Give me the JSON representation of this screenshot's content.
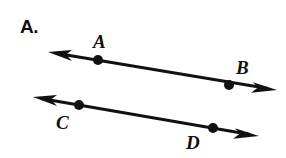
{
  "figure": {
    "part_label": "A.",
    "background_color": "#ffffff",
    "ink_color": "#111111",
    "canvas": {
      "width": 286,
      "height": 158
    },
    "lines": [
      {
        "name": "line-AB",
        "arrow_start": {
          "x": 48,
          "y": 52
        },
        "arrow_end": {
          "x": 277,
          "y": 90
        },
        "stroke_width": 3,
        "points": [
          {
            "id": "A",
            "label": "A",
            "dot": {
              "x": 98,
              "y": 60,
              "r": 5
            },
            "label_pos": {
              "x": 93,
              "y": 32
            }
          },
          {
            "id": "B",
            "label": "B",
            "dot": {
              "x": 229,
              "y": 85,
              "r": 5
            },
            "label_pos": {
              "x": 236,
              "y": 58
            }
          }
        ]
      },
      {
        "name": "line-CD",
        "arrow_start": {
          "x": 33,
          "y": 97
        },
        "arrow_end": {
          "x": 259,
          "y": 136
        },
        "stroke_width": 3,
        "points": [
          {
            "id": "C",
            "label": "C",
            "dot": {
              "x": 79,
              "y": 105,
              "r": 5
            },
            "label_pos": {
              "x": 56,
              "y": 113
            }
          },
          {
            "id": "D",
            "label": "D",
            "dot": {
              "x": 213,
              "y": 128,
              "r": 5
            },
            "label_pos": {
              "x": 186,
              "y": 133
            }
          }
        ]
      }
    ]
  }
}
